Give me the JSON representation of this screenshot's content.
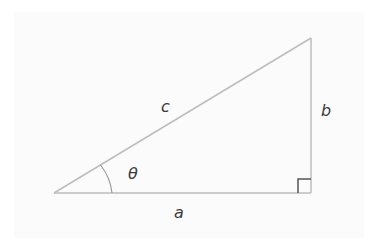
{
  "diagram": {
    "type": "right-triangle",
    "labels": {
      "hypotenuse": "c",
      "opposite": "b",
      "adjacent": "a",
      "angle": "θ"
    },
    "colors": {
      "line": "#bdbdbd",
      "right_angle_marker": "#555555",
      "text": "#3a3a3a",
      "background": "#ffffff"
    }
  }
}
